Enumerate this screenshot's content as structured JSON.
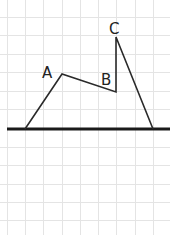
{
  "diagram": {
    "type": "line-drawing-on-grid",
    "width": 170,
    "height": 235,
    "background": "#ffffff",
    "grid": {
      "color": "#e4e4e4",
      "vertical_x": [
        7,
        25,
        43,
        62,
        80,
        98,
        116,
        135,
        153
      ],
      "horizontal_y": [
        17,
        35,
        54,
        72,
        91,
        109,
        147,
        165,
        184,
        202,
        220
      ]
    },
    "axis": {
      "color": "#1a1a1a",
      "x1": 7,
      "x2": 170,
      "y": 129
    },
    "points": {
      "left_foot": {
        "x": 25,
        "y": 129
      },
      "A": {
        "x": 62,
        "y": 74
      },
      "B": {
        "x": 116,
        "y": 92
      },
      "C": {
        "x": 116,
        "y": 37
      },
      "right_foot": {
        "x": 153,
        "y": 129
      }
    },
    "labels": [
      {
        "text": "A",
        "x": 42,
        "y": 78
      },
      {
        "text": "B",
        "x": 101,
        "y": 85
      },
      {
        "text": "C",
        "x": 109,
        "y": 34
      }
    ],
    "line_color": "#2a2a2a"
  }
}
